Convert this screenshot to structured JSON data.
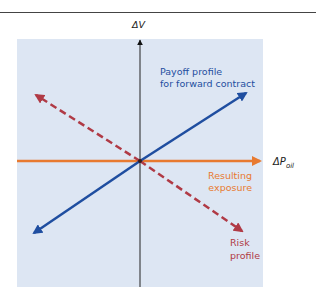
{
  "diagram": {
    "axes": {
      "y_label": "ΔV",
      "x_label_main": "ΔP",
      "x_label_sub": "oil"
    },
    "labels": {
      "payoff_line1": "Payoff profile",
      "payoff_line2": "for forward contract",
      "resulting_line1": "Resulting",
      "resulting_line2": "exposure",
      "risk_line1": "Risk",
      "risk_line2": "profile"
    },
    "colors": {
      "panel_background": "#dde6f3",
      "payoff_line": "#1f4ea0",
      "risk_line": "#b03a45",
      "resulting_line": "#e87a30",
      "axis": "#222222"
    },
    "lines": [
      {
        "name": "Payoff profile for forward contract",
        "style": "solid",
        "direction": "positive slope",
        "from": [
          32,
          234
        ],
        "to": [
          248,
          92
        ]
      },
      {
        "name": "Risk profile",
        "style": "dashed",
        "direction": "negative slope",
        "from": [
          34,
          94
        ],
        "to": [
          244,
          232
        ]
      },
      {
        "name": "Resulting exposure",
        "style": "solid",
        "direction": "horizontal (zero)",
        "from": [
          17,
          161
        ],
        "to": [
          262,
          161
        ]
      }
    ]
  }
}
